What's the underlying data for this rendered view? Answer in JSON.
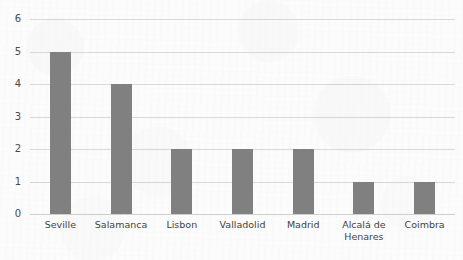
{
  "chart_data": {
    "type": "bar",
    "title": "",
    "subtitle": "",
    "xlabel": "",
    "ylabel": "",
    "categories": [
      "Seville",
      "Salamanca",
      "Lisbon",
      "Valladolid",
      "Madrid",
      "Alcalá de\nHenares",
      "Coimbra"
    ],
    "values": [
      5,
      4,
      2,
      2,
      2,
      1,
      1
    ],
    "ylim": [
      0,
      6
    ],
    "y_ticks": [
      0,
      1,
      2,
      3,
      4,
      5,
      6
    ],
    "y_tick_labels": [
      "0",
      "1",
      "2",
      "3",
      "4",
      "5",
      "6"
    ],
    "grid": true,
    "grid_axis": "y",
    "legend": false,
    "legend_position": "none",
    "orientation": "vertical",
    "colors": {
      "bar": "#808080",
      "gridline": "#d9d9d9",
      "baseline": "#d0d0d0",
      "tick_label": "#4a4a4a",
      "category_label": "#3f3f3f",
      "background": "#fcfcfc"
    }
  }
}
